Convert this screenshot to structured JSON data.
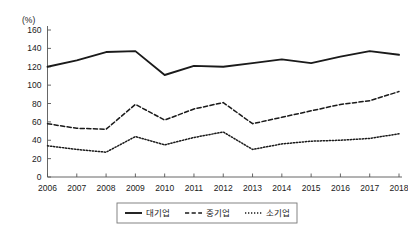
{
  "chart_data": {
    "type": "line",
    "title": "",
    "xlabel": "",
    "ylabel": "",
    "unit_label": "(%)",
    "grid": false,
    "legend_position": "bottom",
    "categories": [
      "2006",
      "2007",
      "2008",
      "2009",
      "2010",
      "2011",
      "2012",
      "2013",
      "2014",
      "2015",
      "2016",
      "2017",
      "2018"
    ],
    "x": [
      2006,
      2007,
      2008,
      2009,
      2010,
      2011,
      2012,
      2013,
      2014,
      2015,
      2016,
      2017,
      2018
    ],
    "ylim": [
      0,
      160
    ],
    "yticks": [
      0,
      20,
      40,
      60,
      80,
      100,
      120,
      140,
      160
    ],
    "ytick_labels": [
      "0",
      "20",
      "40",
      "60",
      "80",
      "100",
      "120",
      "140",
      "160"
    ],
    "series": [
      {
        "name": "대기업",
        "style": "solid",
        "color": "#1a1a1a",
        "values": [
          120,
          127,
          136,
          137,
          111,
          121,
          120,
          124,
          128,
          124,
          131,
          137,
          133
        ]
      },
      {
        "name": "중기업",
        "style": "dashed",
        "color": "#1a1a1a",
        "values": [
          58,
          53,
          52,
          79,
          62,
          74,
          81,
          58,
          65,
          72,
          79,
          83,
          93
        ]
      },
      {
        "name": "소기업",
        "style": "dotted",
        "color": "#1a1a1a",
        "values": [
          34,
          30,
          27,
          44,
          35,
          43,
          49,
          30,
          36,
          39,
          40,
          42,
          47
        ]
      }
    ]
  },
  "legend": {
    "items": [
      {
        "label": "대기업",
        "style": "solid"
      },
      {
        "label": "중기업",
        "style": "dashed"
      },
      {
        "label": "소기업",
        "style": "dotted"
      }
    ]
  },
  "axes": {
    "unit": "(%)"
  }
}
